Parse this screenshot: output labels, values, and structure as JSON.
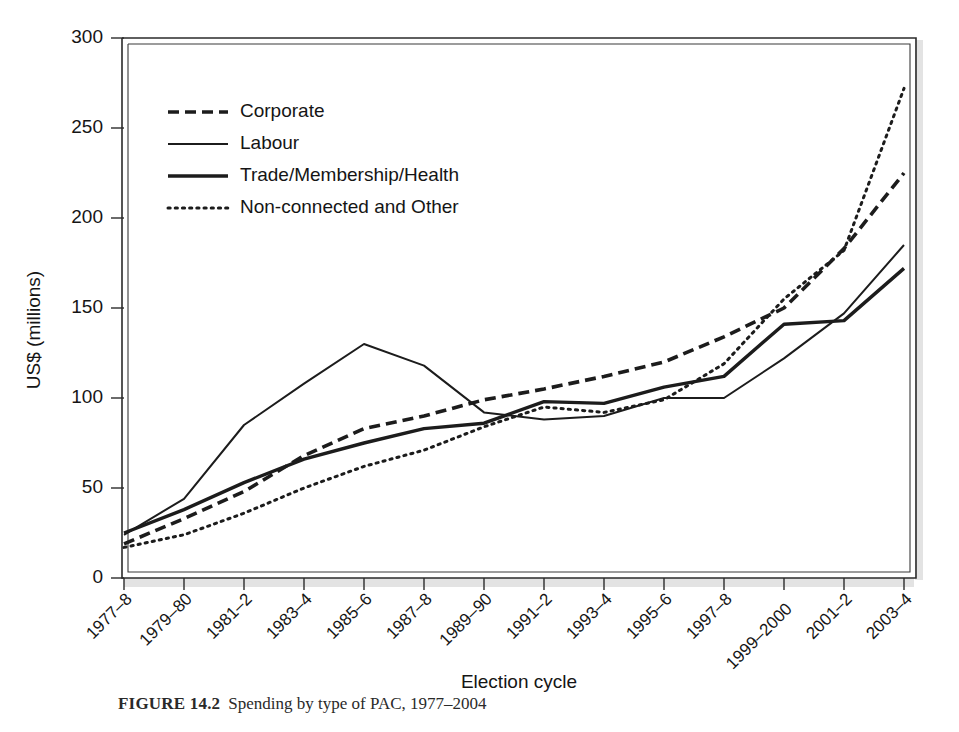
{
  "figure": {
    "caption_label": "FIGURE 14.2",
    "caption_text": "Spending by type of PAC, 1977–2004"
  },
  "chart_data": {
    "type": "line",
    "title": "",
    "xlabel": "Election cycle",
    "ylabel": "US$ (millions)",
    "ylim": [
      0,
      300
    ],
    "yticks": [
      0,
      50,
      100,
      150,
      200,
      250,
      300
    ],
    "grid": false,
    "legend_position": "upper-left-inside",
    "categories": [
      "1977–8",
      "1979–80",
      "1981–2",
      "1983–4",
      "1985–6",
      "1987–8",
      "1989–90",
      "1991–2",
      "1993–4",
      "1995–6",
      "1997–8",
      "1999–2000",
      "2001–2",
      "2003–4"
    ],
    "series": [
      {
        "name": "Corporate",
        "style": "dashed",
        "values": [
          19,
          33,
          48,
          68,
          83,
          90,
          99,
          105,
          112,
          120,
          134,
          150,
          183,
          225
        ]
      },
      {
        "name": "Labour",
        "style": "thin-solid",
        "values": [
          24,
          44,
          85,
          108,
          130,
          118,
          92,
          88,
          90,
          100,
          100,
          122,
          147,
          185
        ]
      },
      {
        "name": "Trade/Membership/Health",
        "style": "thick-solid",
        "values": [
          25,
          38,
          53,
          66,
          75,
          83,
          86,
          98,
          97,
          106,
          112,
          141,
          143,
          172
        ]
      },
      {
        "name": "Non-connected and Other",
        "style": "dotted",
        "values": [
          17,
          24,
          36,
          50,
          62,
          71,
          84,
          95,
          92,
          99,
          119,
          155,
          182,
          272
        ]
      }
    ]
  },
  "legend": {
    "items": [
      {
        "label": "Corporate",
        "style": "dashed"
      },
      {
        "label": "Labour",
        "style": "thin-solid"
      },
      {
        "label": "Trade/Membership/Health",
        "style": "thick-solid"
      },
      {
        "label": "Non-connected and Other",
        "style": "dotted"
      }
    ]
  },
  "axes": {
    "ytick_labels": [
      "0",
      "50",
      "100",
      "150",
      "200",
      "250",
      "300"
    ],
    "xtick_labels": [
      "1977–8",
      "1979–80",
      "1981–2",
      "1983–4",
      "1985–6",
      "1987–8",
      "1989–90",
      "1991–2",
      "1993–4",
      "1995–6",
      "1997–8",
      "1999–2000",
      "2001–2",
      "2003–4"
    ]
  }
}
